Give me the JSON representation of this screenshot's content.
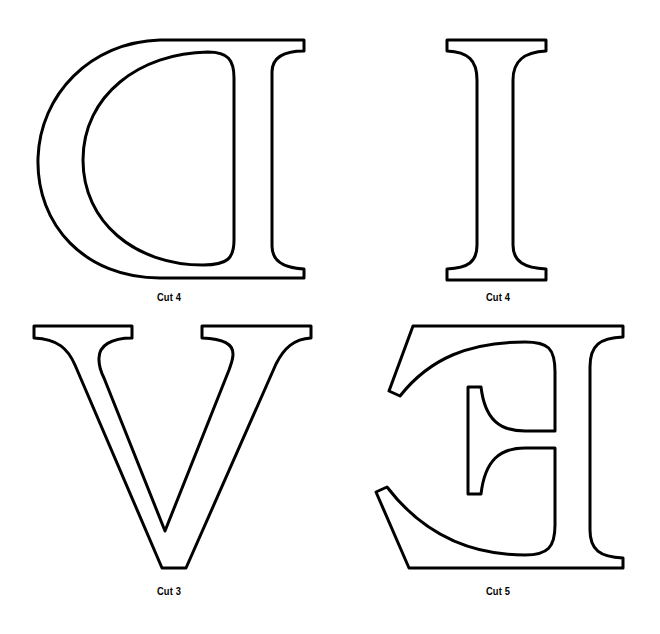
{
  "page": {
    "background": "#ffffff",
    "stroke_color": "#000000"
  },
  "templates": [
    {
      "letter": "D",
      "orientation": "mirrored",
      "label": "Cut 4",
      "position": "top-left"
    },
    {
      "letter": "I",
      "orientation": "normal",
      "label": "Cut 4",
      "position": "top-right"
    },
    {
      "letter": "V",
      "orientation": "normal",
      "label": "Cut 3",
      "position": "bottom-left"
    },
    {
      "letter": "E",
      "orientation": "mirrored",
      "label": "Cut 5",
      "position": "bottom-right"
    }
  ]
}
